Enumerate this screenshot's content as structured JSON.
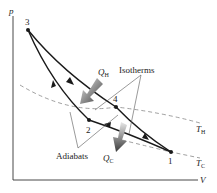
{
  "figure": {
    "type": "p-V diagram (Carnot cycle)",
    "axes": {
      "y_label": "p",
      "x_label": "V"
    },
    "points": [
      {
        "id": "1",
        "label": "1",
        "x": 171,
        "y": 152
      },
      {
        "id": "2",
        "label": "2",
        "x": 89,
        "y": 120
      },
      {
        "id": "3",
        "label": "3",
        "x": 28,
        "y": 30
      },
      {
        "id": "4",
        "label": "4",
        "x": 116,
        "y": 107
      }
    ],
    "labels": {
      "isotherms": "Isotherms",
      "adiabats": "Adiabats",
      "q_hot_main": "Q",
      "q_hot_sub": "H",
      "q_cold_main": "Q",
      "q_cold_sub": "C",
      "t_hot_main": "T",
      "t_hot_sub": "H",
      "t_cold_main": "T",
      "t_cold_sub": "C"
    },
    "colors": {
      "curve": "#1a1a1a",
      "dashed": "#888888",
      "leader": "#555555",
      "heat_arrow": "#555555"
    }
  }
}
